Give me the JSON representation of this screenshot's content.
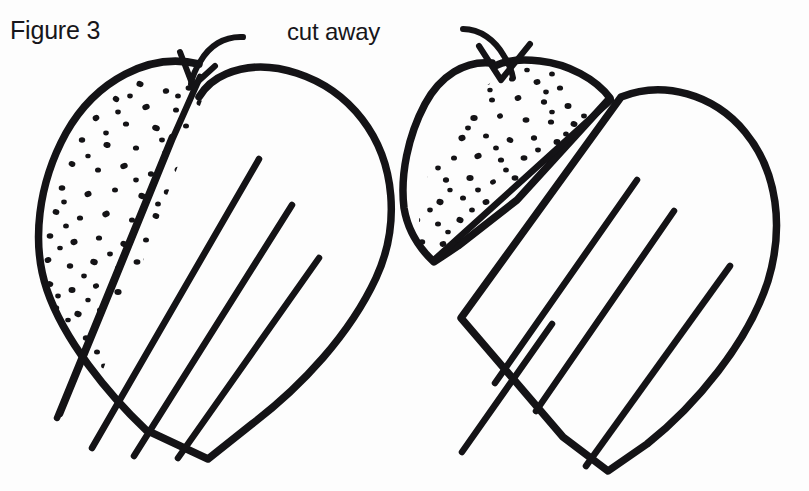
{
  "page": {
    "width": 809,
    "height": 491,
    "background_color": "#fdfdfd",
    "ink_color": "#141316",
    "style": "hand-drawn black and white line art, scanned craft instruction illustration"
  },
  "labels": {
    "figure_caption": "Figure 3",
    "cut_away_annotation": "cut away"
  },
  "annotations": {
    "left_arrow_name": "cut-away-arrow-left",
    "right_arrow_name": "cut-away-arrow-right",
    "arrow_description": "curved arrow pointing down into the top cleft of each heart"
  },
  "figure_data": {
    "type": "line-art-diagram",
    "shape_count": 2,
    "shapes": [
      {
        "name": "heart-left-intact",
        "label": "heart with cut-away section still attached",
        "stippled_region": "upper-left lobe",
        "stipple_dot_count": 96,
        "pleat_line_count": 3,
        "cut_line": "diagonal line from top cleft to lower-left edge",
        "detached": false
      },
      {
        "name": "heart-right-separated",
        "label": "heart with cut-away section removed and set aside",
        "stippled_region": "detached left lobe piece",
        "stipple_dot_count": 104,
        "pleat_line_count": 3,
        "cut_line": "diagonal line along the separated edge",
        "detached": true
      }
    ]
  }
}
